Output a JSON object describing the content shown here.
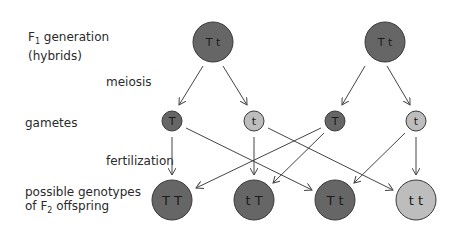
{
  "labels": {
    "f1_line1_prefix": "F",
    "f1_sub": "1",
    "f1_line1_suffix": " generation",
    "f1_line2": "(hybrids)",
    "meiosis": "meiosis",
    "gametes": "gametes",
    "fertilization": "fertilization",
    "f2_line1": "possible genotypes",
    "f2_line2_prefix": "of F",
    "f2_sub": "2",
    "f2_line2_suffix": " offspring"
  },
  "colors": {
    "dominant": "#666666",
    "recessive": "#bdbdbd",
    "stroke": "#3a3a3a",
    "arrow": "#444444"
  },
  "f1": [
    {
      "genotype": "T t"
    },
    {
      "genotype": "T t"
    }
  ],
  "gametes": [
    {
      "allele": "T"
    },
    {
      "allele": "t"
    },
    {
      "allele": "T"
    },
    {
      "allele": "t"
    }
  ],
  "f2": [
    {
      "genotype": "T T"
    },
    {
      "genotype": "t T"
    },
    {
      "genotype": "T t"
    },
    {
      "genotype": "t t"
    }
  ]
}
